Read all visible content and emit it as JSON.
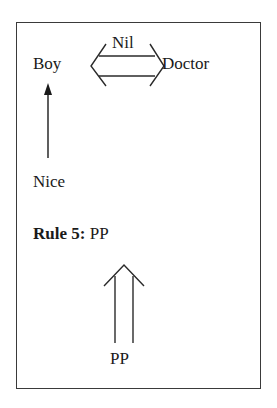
{
  "diagram": {
    "top_row": {
      "left_word": "Boy",
      "right_word": "Doctor",
      "link_label": "Nil",
      "link_type": "double-headed-double-arrow"
    },
    "vertical_link": {
      "from": "Nice",
      "to": "Boy",
      "arrow_type": "single-arrow-up"
    },
    "bottom_word": "Nice",
    "rule": {
      "label": "Rule 5:",
      "value": "PP"
    },
    "rule_arrow": {
      "arrow_type": "double-arrow-up",
      "source": "PP"
    }
  },
  "colors": {
    "ink": "#1a1a1a",
    "border": "#3a3a3a",
    "background": "#ffffff"
  }
}
